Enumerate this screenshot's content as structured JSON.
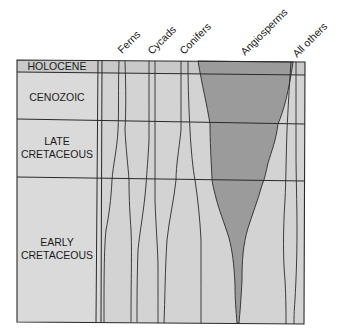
{
  "diagram": {
    "type": "spindle-diversity-diagram",
    "colors": {
      "background": "#ffffff",
      "panel_fill": "#d4d4d4",
      "label_column_fill": "#dcdcdc",
      "angiosperm_fill": "#9a9a9a",
      "line": "#2a2a2a"
    },
    "eras": [
      {
        "id": "holocene",
        "label_lines": [
          "HOLOCENE"
        ]
      },
      {
        "id": "cenozoic",
        "label_lines": [
          "CENOZOIC"
        ]
      },
      {
        "id": "late-cretaceous",
        "label_lines": [
          "LATE",
          "CRETACEOUS"
        ]
      },
      {
        "id": "early-cretaceous",
        "label_lines": [
          "EARLY",
          "CRETACEOUS"
        ]
      }
    ],
    "columns": [
      {
        "id": "ferns",
        "label": "Ferns"
      },
      {
        "id": "cycads",
        "label": "Cycads"
      },
      {
        "id": "conifers",
        "label": "Conifers"
      },
      {
        "id": "angiosperms",
        "label": "Angiosperms"
      },
      {
        "id": "all-others",
        "label": "All others"
      }
    ]
  }
}
